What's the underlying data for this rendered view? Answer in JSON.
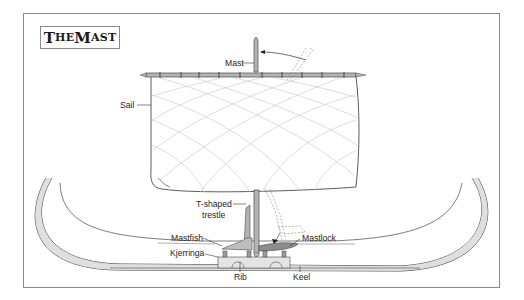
{
  "title": {
    "text": "The Mast",
    "first_cap": "T",
    "rest1": "HE ",
    "second_cap": "M",
    "rest2": "AST"
  },
  "labels": {
    "mast": "Mast",
    "sail": "Sail",
    "trestle_line1": "T-shaped",
    "trestle_line2": "trestle",
    "mastfish": "Mastfish",
    "mastlock": "Mastlock",
    "kjerringa": "Kjerringa",
    "rib": "Rib",
    "keel": "Keel"
  },
  "colors": {
    "frame": "#8a8a8a",
    "line": "#4a4a4a",
    "hull_fill": "#dcdcdc",
    "sail_grid": "#c8c8c8",
    "mast_fill": "#b4b4b4"
  }
}
